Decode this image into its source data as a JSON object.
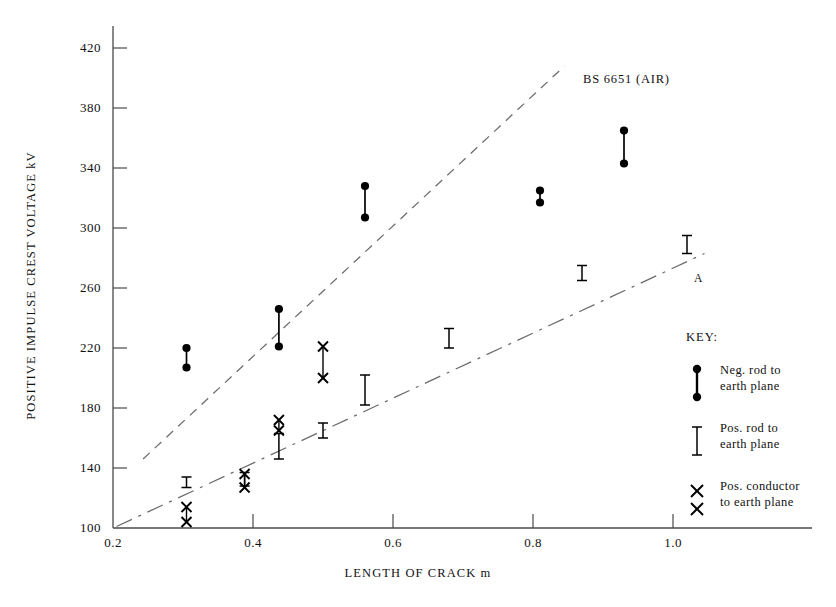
{
  "chart_data": {
    "type": "scatter",
    "title": "",
    "xlabel": "LENGTH OF CRACK m",
    "ylabel": "POSITIVE IMPULSE CREST VOLTAGE kV",
    "xlim": [
      0.18,
      1.1
    ],
    "ylim": [
      100,
      437
    ],
    "xticks": [
      0.2,
      0.4,
      0.6,
      0.8,
      1.0
    ],
    "xticklabels": [
      "0.2",
      "0.4",
      "0.6",
      "0.8",
      "1.0"
    ],
    "yticks": [
      100,
      140,
      180,
      220,
      260,
      300,
      340,
      380,
      420
    ],
    "yticklabels": [
      "100",
      "140",
      "180",
      "220",
      "260",
      "300",
      "340",
      "380",
      "420"
    ],
    "grid": false,
    "legend_position": "right",
    "series": [
      {
        "name": "Neg. rod to earth plane",
        "marker": "filled-circle-pair",
        "points": [
          {
            "x": 0.305,
            "low": 207,
            "high": 220
          },
          {
            "x": 0.437,
            "low": 221,
            "high": 246
          },
          {
            "x": 0.56,
            "low": 307,
            "high": 328
          },
          {
            "x": 0.81,
            "low": 317,
            "high": 325
          },
          {
            "x": 0.93,
            "low": 343,
            "high": 365
          }
        ]
      },
      {
        "name": "Pos. rod to earth plane",
        "marker": "capped-bar",
        "points": [
          {
            "x": 0.305,
            "low": 127,
            "high": 134
          },
          {
            "x": 0.388,
            "low": 128,
            "high": 137
          },
          {
            "x": 0.437,
            "low": 146,
            "high": 163
          },
          {
            "x": 0.5,
            "low": 160,
            "high": 170
          },
          {
            "x": 0.56,
            "low": 182,
            "high": 202
          },
          {
            "x": 0.68,
            "low": 220,
            "high": 233
          },
          {
            "x": 0.87,
            "low": 265,
            "high": 275
          },
          {
            "x": 1.02,
            "low": 283,
            "high": 295
          }
        ]
      },
      {
        "name": "Pos. conductor to earth plane",
        "marker": "cross-pair",
        "points": [
          {
            "x": 0.305,
            "low": 104,
            "high": 114
          },
          {
            "x": 0.388,
            "low": 127,
            "high": 136
          },
          {
            "x": 0.437,
            "low": 165,
            "high": 172
          },
          {
            "x": 0.5,
            "low": 200,
            "high": 221
          }
        ]
      }
    ],
    "reference_lines": [
      {
        "name": "BS 6651 (AIR)",
        "style": "dashed",
        "label": "BS 6651 (AIR)",
        "from": {
          "x": 0.243,
          "y": 146
        },
        "to": {
          "x": 0.845,
          "y": 408
        }
      },
      {
        "name": "A",
        "style": "dash-dot",
        "label": "A",
        "from": {
          "x": 0.205,
          "y": 101
        },
        "to": {
          "x": 1.045,
          "y": 283
        }
      }
    ]
  },
  "axes": {
    "ylabel": "POSITIVE IMPULSE CREST VOLTAGE kV",
    "xlabel": "LENGTH OF CRACK m"
  },
  "annotations": {
    "bs_line_label": "BS 6651 (AIR)",
    "a_line_label": "A"
  },
  "legend": {
    "title": "KEY:",
    "items": [
      {
        "symbol": "filled-circle-pair",
        "line1": "Neg. rod to",
        "line2": "earth plane"
      },
      {
        "symbol": "capped-bar",
        "line1": "Pos. rod to",
        "line2": "earth plane"
      },
      {
        "symbol": "cross-pair",
        "line1": "Pos. conductor",
        "line2": "to earth plane"
      }
    ]
  }
}
